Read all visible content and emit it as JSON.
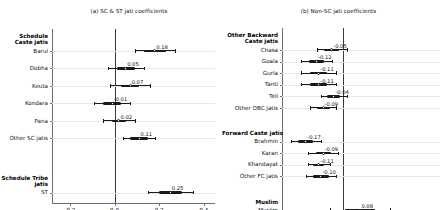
{
  "figure": {
    "panels": [
      {
        "id": "panel-a",
        "title": "(a) SC & ST jati coefficients",
        "xticks": [
          "-0.2",
          "0.0",
          "0.2",
          "0.4"
        ],
        "xtick_values": [
          -0.2,
          0.0,
          0.2,
          0.4
        ],
        "groups": [
          {
            "label": "Schedule\nCaste jatis",
            "label_lines": [
              "Schedule",
              "Caste jatis"
            ],
            "rows": [
              {
                "label": "Barui",
                "value": 0.18,
                "value_label": "0.18",
                "ci_low": 0.09,
                "ci_high": 0.27,
                "ci_inner_low": 0.13,
                "ci_inner_high": 0.23
              },
              {
                "label": "Dobha",
                "value": 0.05,
                "value_label": "0.05",
                "ci_low": -0.03,
                "ci_high": 0.13,
                "ci_inner_low": 0.01,
                "ci_inner_high": 0.09
              },
              {
                "label": "Keuta",
                "value": 0.07,
                "value_label": "0.07",
                "ci_low": -0.02,
                "ci_high": 0.16,
                "ci_inner_low": 0.03,
                "ci_inner_high": 0.11
              },
              {
                "label": "Kondara",
                "value": -0.01,
                "value_label": "-0.01",
                "ci_low": -0.09,
                "ci_high": 0.07,
                "ci_inner_low": -0.05,
                "ci_inner_high": 0.03
              },
              {
                "label": "Pana",
                "value": 0.02,
                "value_label": "0.02",
                "ci_low": -0.05,
                "ci_high": 0.09,
                "ci_inner_low": -0.01,
                "ci_inner_high": 0.05
              },
              {
                "label": "Other SC jatis",
                "value": 0.11,
                "value_label": "0.11",
                "ci_low": 0.04,
                "ci_high": 0.18,
                "ci_inner_low": 0.07,
                "ci_inner_high": 0.15
              }
            ]
          },
          {
            "label": "Schedule Tribe\njatis",
            "label_lines": [
              "Schedule Tribe",
              "jatis"
            ],
            "rows": [
              {
                "label": "ST",
                "value": 0.25,
                "value_label": "0.25",
                "ci_low": 0.15,
                "ci_high": 0.35,
                "ci_inner_low": 0.2,
                "ci_inner_high": 0.3
              }
            ]
          }
        ]
      },
      {
        "id": "panel-b",
        "title": "(b) Non-SC jati coefficients",
        "xticks": [
          "-0.2",
          "0.0",
          "0.2",
          "0.4"
        ],
        "xtick_values": [
          -0.2,
          0.0,
          0.2,
          0.4
        ],
        "groups": [
          {
            "label": "Other Backward\nCaste jatis",
            "label_lines": [
              "Other Backward",
              "Caste jatis"
            ],
            "rows": [
              {
                "label": "Chasa",
                "value": -0.05,
                "value_label": "-0.05",
                "ci_low": -0.12,
                "ci_high": 0.02,
                "ci_inner_low": -0.085,
                "ci_inner_high": -0.015
              },
              {
                "label": "Goala",
                "value": -0.12,
                "value_label": "-0.12",
                "ci_low": -0.19,
                "ci_high": -0.05,
                "ci_inner_low": -0.155,
                "ci_inner_high": -0.085
              },
              {
                "label": "Gurla",
                "value": -0.11,
                "value_label": "-0.11",
                "ci_low": -0.19,
                "ci_high": -0.03,
                "ci_inner_low": -0.15,
                "ci_inner_high": -0.07
              },
              {
                "label": "Tanti",
                "value": -0.11,
                "value_label": "-0.11",
                "ci_low": -0.19,
                "ci_high": -0.03,
                "ci_inner_low": -0.15,
                "ci_inner_high": -0.07
              },
              {
                "label": "Teli",
                "value": -0.04,
                "value_label": "-0.04",
                "ci_low": -0.1,
                "ci_high": 0.02,
                "ci_inner_low": -0.07,
                "ci_inner_high": -0.01
              },
              {
                "label": "Other OBC jatis",
                "value": -0.09,
                "value_label": "-0.09",
                "ci_low": -0.15,
                "ci_high": -0.03,
                "ci_inner_low": -0.12,
                "ci_inner_high": -0.06
              }
            ]
          },
          {
            "label": "Forward Caste jatis",
            "label_lines": [
              "Forward Caste jatis"
            ],
            "rows": [
              {
                "label": "Brahmin",
                "value": -0.17,
                "value_label": "-0.17",
                "ci_low": -0.24,
                "ci_high": -0.1,
                "ci_inner_low": -0.205,
                "ci_inner_high": -0.135
              },
              {
                "label": "Karan",
                "value": -0.09,
                "value_label": "-0.09",
                "ci_low": -0.16,
                "ci_high": -0.02,
                "ci_inner_low": -0.125,
                "ci_inner_high": -0.055
              },
              {
                "label": "Khandayat",
                "value": -0.11,
                "value_label": "-0.11",
                "ci_low": -0.16,
                "ci_high": -0.06,
                "ci_inner_low": -0.135,
                "ci_inner_high": -0.085
              },
              {
                "label": "Other FC jatis",
                "value": -0.1,
                "value_label": "-0.10",
                "ci_low": -0.17,
                "ci_high": -0.03,
                "ci_inner_low": -0.135,
                "ci_inner_high": -0.065
              }
            ]
          },
          {
            "label": "Muslim",
            "label_lines": [
              "Muslim"
            ],
            "rows": [
              {
                "label": "Muslim",
                "value": 0.08,
                "value_label": "0.08",
                "ci_low": -0.06,
                "ci_high": 0.22,
                "ci_inner_low": 0.01,
                "ci_inner_high": 0.15
              }
            ]
          }
        ]
      }
    ]
  },
  "chart_data": {
    "type": "scatter",
    "subtype": "coefficient-plot-with-confidence-intervals",
    "title": "",
    "xlabel": "",
    "ylabel": "",
    "xlim": [
      -0.28,
      0.45
    ],
    "grid": true,
    "legend": "none",
    "reference_line": 0.0,
    "xticks": [
      -0.2,
      0.0,
      0.2,
      0.4
    ],
    "panels": [
      {
        "panel": "(a) SC & ST jati coefficients",
        "groups": [
          {
            "group": "Schedule Caste jatis",
            "points": [
              {
                "label": "Barui",
                "estimate": 0.18,
                "ci_low": 0.09,
                "ci_high": 0.27
              },
              {
                "label": "Dobha",
                "estimate": 0.05,
                "ci_low": -0.03,
                "ci_high": 0.13
              },
              {
                "label": "Keuta",
                "estimate": 0.07,
                "ci_low": -0.02,
                "ci_high": 0.16
              },
              {
                "label": "Kondara",
                "estimate": -0.01,
                "ci_low": -0.09,
                "ci_high": 0.07
              },
              {
                "label": "Pana",
                "estimate": 0.02,
                "ci_low": -0.05,
                "ci_high": 0.09
              },
              {
                "label": "Other SC jatis",
                "estimate": 0.11,
                "ci_low": 0.04,
                "ci_high": 0.18
              }
            ]
          },
          {
            "group": "Schedule Tribe jatis",
            "points": [
              {
                "label": "ST",
                "estimate": 0.25,
                "ci_low": 0.15,
                "ci_high": 0.35
              }
            ]
          }
        ]
      },
      {
        "panel": "(b) Non-SC jati coefficients",
        "groups": [
          {
            "group": "Other Backward Caste jatis",
            "points": [
              {
                "label": "Chasa",
                "estimate": -0.05,
                "ci_low": -0.12,
                "ci_high": 0.02
              },
              {
                "label": "Goala",
                "estimate": -0.12,
                "ci_low": -0.19,
                "ci_high": -0.05
              },
              {
                "label": "Gurla",
                "estimate": -0.11,
                "ci_low": -0.19,
                "ci_high": -0.03
              },
              {
                "label": "Tanti",
                "estimate": -0.11,
                "ci_low": -0.19,
                "ci_high": -0.03
              },
              {
                "label": "Teli",
                "estimate": -0.04,
                "ci_low": -0.1,
                "ci_high": 0.02
              },
              {
                "label": "Other OBC jatis",
                "estimate": -0.09,
                "ci_low": -0.15,
                "ci_high": -0.03
              }
            ]
          },
          {
            "group": "Forward Caste jatis",
            "points": [
              {
                "label": "Brahmin",
                "estimate": -0.17,
                "ci_low": -0.24,
                "ci_high": -0.1
              },
              {
                "label": "Karan",
                "estimate": -0.09,
                "ci_low": -0.16,
                "ci_high": -0.02
              },
              {
                "label": "Khandayat",
                "estimate": -0.11,
                "ci_low": -0.16,
                "ci_high": -0.06
              },
              {
                "label": "Other FC jatis",
                "estimate": -0.1,
                "ci_low": -0.17,
                "ci_high": -0.03
              }
            ]
          },
          {
            "group": "Muslim",
            "points": [
              {
                "label": "Muslim",
                "estimate": 0.08,
                "ci_low": -0.06,
                "ci_high": 0.22
              }
            ]
          }
        ]
      }
    ]
  }
}
